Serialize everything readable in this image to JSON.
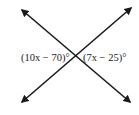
{
  "diagram": {
    "type": "intersecting-lines",
    "labels": {
      "left_angle": "(10x − 70)°",
      "right_angle": "(7x − 25)°"
    },
    "line_color": "#1a1a1a",
    "text_color": "#222222"
  }
}
